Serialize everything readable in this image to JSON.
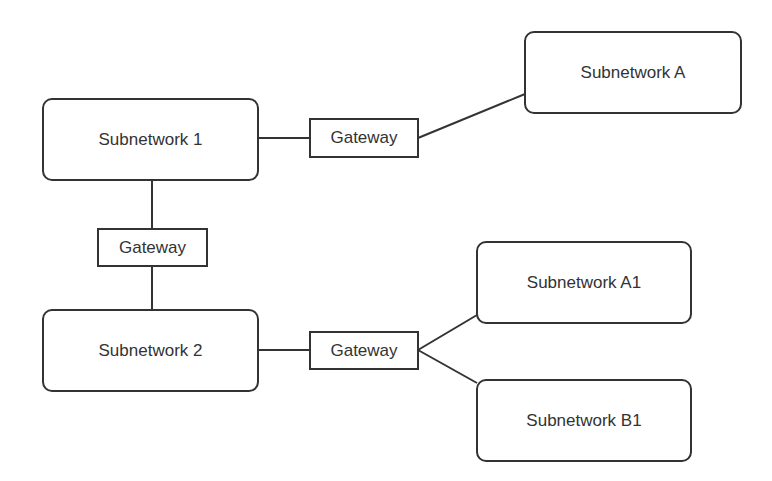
{
  "diagram": {
    "colors": {
      "stroke": "#333333",
      "text": "#333333",
      "background": "#ffffff"
    },
    "nodes": {
      "subnetwork_1": {
        "label": "Subnetwork 1"
      },
      "subnetwork_2": {
        "label": "Subnetwork 2"
      },
      "subnetwork_a": {
        "label": "Subnetwork A"
      },
      "subnetwork_a1": {
        "label": "Subnetwork A1"
      },
      "subnetwork_b1": {
        "label": "Subnetwork B1"
      },
      "gateway_1_a": {
        "label": "Gateway"
      },
      "gateway_1_2": {
        "label": "Gateway"
      },
      "gateway_2_a1b1": {
        "label": "Gateway"
      }
    },
    "edges": [
      {
        "from": "subnetwork_1",
        "to": "gateway_1_a"
      },
      {
        "from": "gateway_1_a",
        "to": "subnetwork_a"
      },
      {
        "from": "subnetwork_1",
        "to": "gateway_1_2"
      },
      {
        "from": "gateway_1_2",
        "to": "subnetwork_2"
      },
      {
        "from": "subnetwork_2",
        "to": "gateway_2_a1b1"
      },
      {
        "from": "gateway_2_a1b1",
        "to": "subnetwork_a1"
      },
      {
        "from": "gateway_2_a1b1",
        "to": "subnetwork_b1"
      }
    ]
  }
}
